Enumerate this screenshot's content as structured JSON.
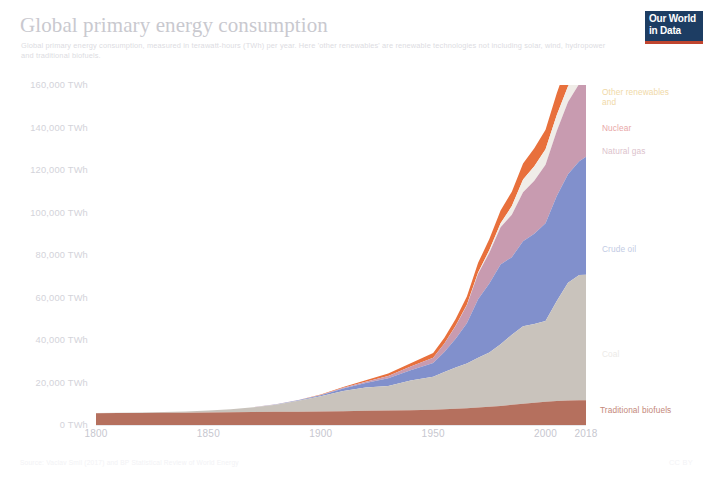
{
  "header": {
    "title": "Global primary energy consumption",
    "subtitle": "Global primary energy consumption, measured in terawatt-hours (TWh) per year. Here 'other renewables' are renewable technologies not including solar, wind, hydropower and traditional biofuels.",
    "logo_line1": "Our World",
    "logo_line2": "in Data"
  },
  "footer": {
    "source": "Source: Vaclav Smil (2017) and BP Statistical Review of World Energy",
    "license": "CC BY"
  },
  "chart_data": {
    "type": "area",
    "title": "Global primary energy consumption",
    "xlabel": "",
    "ylabel": "",
    "unit": "TWh",
    "stacked": true,
    "grid": false,
    "legend_position": "right-inline",
    "xlim": [
      1800,
      2018
    ],
    "ylim": [
      0,
      160000
    ],
    "ytick_labels": [
      "0 TWh",
      "20,000 TWh",
      "40,000 TWh",
      "60,000 TWh",
      "80,000 TWh",
      "100,000 TWh",
      "120,000 TWh",
      "140,000 TWh",
      "160,000 TWh"
    ],
    "ytick_values": [
      0,
      20000,
      40000,
      60000,
      80000,
      100000,
      120000,
      140000,
      160000
    ],
    "xtick_labels": [
      "1800",
      "1850",
      "1900",
      "1950",
      "2000",
      "2018"
    ],
    "xtick_values": [
      1800,
      1850,
      1900,
      1950,
      2000,
      2018
    ],
    "x": [
      1800,
      1810,
      1820,
      1830,
      1840,
      1850,
      1860,
      1870,
      1880,
      1890,
      1900,
      1910,
      1920,
      1930,
      1940,
      1950,
      1955,
      1960,
      1965,
      1970,
      1975,
      1980,
      1985,
      1990,
      1995,
      2000,
      2005,
      2010,
      2015,
      2018
    ],
    "series": [
      {
        "name": "Traditional biofuels",
        "color": "#b5705e",
        "label_color": "#c08070",
        "values": [
          5556,
          5610,
          5670,
          5730,
          5800,
          5890,
          5980,
          6080,
          6180,
          6290,
          6400,
          6520,
          6650,
          6800,
          7000,
          7200,
          7400,
          7600,
          7900,
          8200,
          8600,
          9000,
          9500,
          10000,
          10500,
          11000,
          11300,
          11500,
          11600,
          11700
        ]
      },
      {
        "name": "Coal",
        "color": "#c9c3bc",
        "label_color": "#e0dcd6",
        "values": [
          97,
          150,
          230,
          360,
          580,
          920,
          1450,
          2250,
          3400,
          5100,
          7100,
          9500,
          11000,
          11500,
          14000,
          15500,
          17500,
          19500,
          21000,
          23500,
          25500,
          29000,
          33000,
          36500,
          37000,
          38000,
          47000,
          55500,
          59000,
          59000
        ]
      },
      {
        "name": "Crude oil",
        "color": "#8190cc",
        "label_color": "#a8b2dc",
        "values": [
          0,
          0,
          0,
          0,
          0,
          0,
          10,
          40,
          110,
          260,
          520,
          1200,
          2100,
          3700,
          4800,
          6500,
          9500,
          13500,
          19000,
          27500,
          32500,
          37500,
          36500,
          40000,
          42500,
          46000,
          49500,
          51000,
          53500,
          55500
        ]
      },
      {
        "name": "Natural gas",
        "color": "#c89bb0",
        "label_color": "#dcb6c6",
        "values": [
          0,
          0,
          0,
          0,
          0,
          0,
          0,
          5,
          20,
          60,
          130,
          300,
          600,
          1100,
          1700,
          2500,
          4000,
          6000,
          8500,
          12000,
          14500,
          17500,
          20000,
          23000,
          25000,
          27500,
          30500,
          34000,
          36500,
          39000
        ]
      },
      {
        "name": "Nuclear",
        "color": "#f0ede8",
        "label_color": "#f3d9d9",
        "values": [
          0,
          0,
          0,
          0,
          0,
          0,
          0,
          0,
          0,
          0,
          0,
          0,
          0,
          0,
          0,
          0,
          10,
          60,
          200,
          600,
          1200,
          2000,
          4000,
          6000,
          6800,
          7300,
          7600,
          7400,
          6700,
          7000
        ]
      },
      {
        "name": "Other renewables",
        "color": "#e8703c",
        "label_color": "#f0d9a8",
        "values": [
          0,
          0,
          0,
          0,
          0,
          0,
          5,
          15,
          40,
          90,
          200,
          400,
          700,
          1100,
          1600,
          2200,
          2700,
          3200,
          3900,
          4500,
          5200,
          6000,
          6800,
          7600,
          8400,
          9200,
          10200,
          11800,
          14500,
          16500
        ]
      }
    ],
    "series_labels": [
      {
        "text": "Other renewables",
        "line2": "and",
        "color": "#f0d9a8",
        "top": 88,
        "left": 602
      },
      {
        "text": "Nuclear",
        "color": "#e8a7a7",
        "top": 124,
        "left": 602
      },
      {
        "text": "Natural gas",
        "color": "#dcc2cc",
        "top": 147,
        "left": 602
      },
      {
        "text": "Crude oil",
        "color": "#c2cbe4",
        "top": 245,
        "left": 602
      },
      {
        "text": "Coal",
        "color": "#eceae7",
        "top": 350,
        "left": 602
      },
      {
        "text": "Traditional biofuels",
        "color": "#c4887a",
        "top": 406,
        "left": 600
      }
    ]
  }
}
